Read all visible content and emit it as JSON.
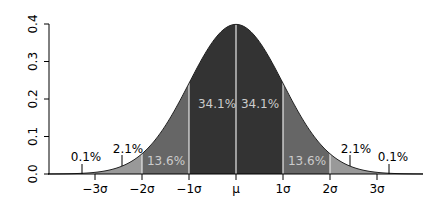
{
  "chart_data": {
    "type": "area",
    "title": "",
    "xlabel": "",
    "ylabel": "",
    "ylim": [
      0.0,
      0.4
    ],
    "xlim": [
      -4.0,
      4.0
    ],
    "grid": false,
    "y_ticks": [
      "0.0",
      "0.1",
      "0.2",
      "0.3",
      "0.4"
    ],
    "x_ticks": [
      "−3σ",
      "−2σ",
      "−1σ",
      "μ",
      "1σ",
      "2σ",
      "3σ"
    ],
    "x_tick_values": [
      -3,
      -2,
      -1,
      0,
      1,
      2,
      3
    ],
    "distribution": "normal",
    "mean": 0,
    "std": 1,
    "peak": 0.3989,
    "regions": [
      {
        "from": -1,
        "to": 0,
        "percent": "34.1%",
        "color": "#333333"
      },
      {
        "from": 0,
        "to": 1,
        "percent": "34.1%",
        "color": "#333333"
      },
      {
        "from": -2,
        "to": -1,
        "percent": "13.6%",
        "color": "#666666"
      },
      {
        "from": 1,
        "to": 2,
        "percent": "13.6%",
        "color": "#666666"
      },
      {
        "from": -3,
        "to": -2,
        "percent": "2.1%",
        "color": "#999999"
      },
      {
        "from": 2,
        "to": 3,
        "percent": "2.1%",
        "color": "#999999"
      },
      {
        "from": -4,
        "to": -3,
        "percent": "0.1%",
        "color": "#cccccc"
      },
      {
        "from": 3,
        "to": 4,
        "percent": "0.1%",
        "color": "#cccccc"
      }
    ]
  },
  "labels": {
    "center_left": "34.1%",
    "center_right": "34.1%",
    "mid_left": "13.6%",
    "mid_right": "13.6%",
    "outer_left": "2.1%",
    "outer_right": "2.1%",
    "tail_left": "0.1%",
    "tail_right": "0.1%"
  },
  "axis": {
    "y": [
      "0.0",
      "0.1",
      "0.2",
      "0.3",
      "0.4"
    ],
    "x": [
      "−3σ",
      "−2σ",
      "−1σ",
      "μ",
      "1σ",
      "2σ",
      "3σ"
    ]
  }
}
